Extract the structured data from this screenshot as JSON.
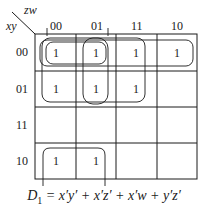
{
  "kmap": {
    "var_col": "zw",
    "var_row": "xy",
    "col_labels": [
      "00",
      "01",
      "11",
      "10"
    ],
    "row_labels": [
      "00",
      "01",
      "11",
      "10"
    ],
    "cells": [
      [
        "1",
        "1",
        "1",
        "1"
      ],
      [
        "1",
        "1",
        "1",
        ""
      ],
      [
        "",
        "",
        "",
        ""
      ],
      [
        "1",
        "1",
        "",
        ""
      ]
    ],
    "groupings": [
      "x'y'",
      "x'z'",
      "x'w",
      "y'z'"
    ]
  },
  "equation": {
    "lhs": "D",
    "lhs_sub": "1",
    "rhs": " = x′y′ + x′z′ + x′w + y′z′"
  },
  "colors": {
    "line": "#1a1a1a",
    "background": "#ffffff"
  }
}
